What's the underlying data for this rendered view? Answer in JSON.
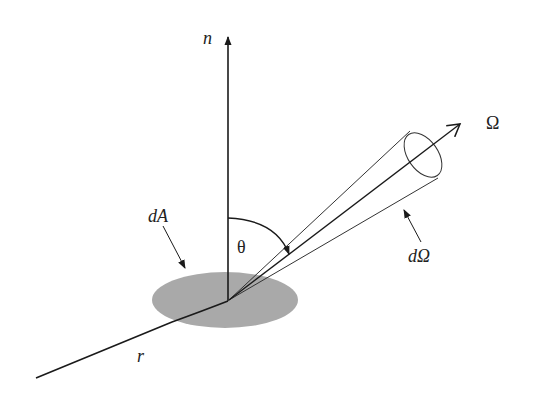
{
  "diagram": {
    "type": "radiance-geometry",
    "labels": {
      "normal": "n",
      "direction": "Ω",
      "area": "dA",
      "angle": "θ",
      "solid_angle": "dΩ",
      "ray": "r"
    },
    "colors": {
      "line": "#1a1a1a",
      "area_fill": "#a9a9a9",
      "background": "#ffffff"
    }
  }
}
